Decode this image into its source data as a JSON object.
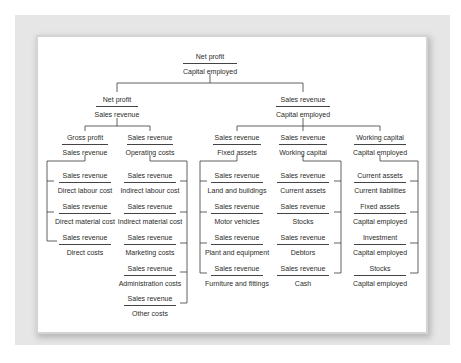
{
  "diagram": {
    "nodes": [
      {
        "id": "root",
        "num": "Net profit",
        "den": "Capital employed",
        "x": 210,
        "y": 52,
        "w": 54
      },
      {
        "id": "l1_left",
        "num": "Net profit",
        "den": "Sales revenue",
        "x": 117,
        "y": 95,
        "w": 42
      },
      {
        "id": "l1_right",
        "num": "Sales revenue",
        "den": "Capital employed",
        "x": 303,
        "y": 95,
        "w": 54
      },
      {
        "id": "gross_profit",
        "num": "Gross profit",
        "den": "Sales revenue",
        "x": 85,
        "y": 133,
        "w": 46
      },
      {
        "id": "operating_costs",
        "num": "Sales revenue",
        "den": "Operating costs",
        "x": 150,
        "y": 133,
        "w": 46
      },
      {
        "id": "fixed_assets",
        "num": "Sales revenue",
        "den": "Fixed assets",
        "x": 237,
        "y": 133,
        "w": 48
      },
      {
        "id": "working_capital",
        "num": "Sales revenue",
        "den": "Working capital",
        "x": 303,
        "y": 133,
        "w": 48
      },
      {
        "id": "wc_capital",
        "num": "Working capital",
        "den": "Capital employed",
        "x": 380,
        "y": 133,
        "w": 52
      },
      {
        "id": "direct_labour",
        "num": "Sales revenue",
        "den": "Direct labour cost",
        "x": 85,
        "y": 171,
        "w": 52
      },
      {
        "id": "direct_material",
        "num": "Sales revenue",
        "den": "Direct material cost",
        "x": 85,
        "y": 202,
        "w": 52
      },
      {
        "id": "direct_costs",
        "num": "Sales revenue",
        "den": "Direct costs",
        "x": 85,
        "y": 233,
        "w": 52
      },
      {
        "id": "indirect_labour",
        "num": "Sales revenue",
        "den": "Indirect labour cost",
        "x": 150,
        "y": 171,
        "w": 52
      },
      {
        "id": "indirect_material",
        "num": "Sales revenue",
        "den": "Indirect material cost",
        "x": 150,
        "y": 202,
        "w": 52
      },
      {
        "id": "marketing",
        "num": "Sales revenue",
        "den": "Marketing costs",
        "x": 150,
        "y": 233,
        "w": 52
      },
      {
        "id": "administration",
        "num": "Sales revenue",
        "den": "Administration costs",
        "x": 150,
        "y": 264,
        "w": 52
      },
      {
        "id": "other_costs",
        "num": "Sales revenue",
        "den": "Other costs",
        "x": 150,
        "y": 294,
        "w": 52
      },
      {
        "id": "land_buildings",
        "num": "Sales revenue",
        "den": "Land and buildings",
        "x": 237,
        "y": 171,
        "w": 52
      },
      {
        "id": "motor_vehicles",
        "num": "Sales revenue",
        "den": "Motor vehicles",
        "x": 237,
        "y": 202,
        "w": 52
      },
      {
        "id": "plant_equipment",
        "num": "Sales revenue",
        "den": "Plant and equipment",
        "x": 237,
        "y": 233,
        "w": 52
      },
      {
        "id": "furniture",
        "num": "Sales revenue",
        "den": "Furniture and fittings",
        "x": 237,
        "y": 264,
        "w": 52
      },
      {
        "id": "current_assets",
        "num": "Sales revenue",
        "den": "Current assets",
        "x": 303,
        "y": 171,
        "w": 52
      },
      {
        "id": "stocks",
        "num": "Sales revenue",
        "den": "Stocks",
        "x": 303,
        "y": 202,
        "w": 52
      },
      {
        "id": "debtors",
        "num": "Sales revenue",
        "den": "Debtors",
        "x": 303,
        "y": 233,
        "w": 52
      },
      {
        "id": "cash",
        "num": "Sales revenue",
        "den": "Cash",
        "x": 303,
        "y": 264,
        "w": 52
      },
      {
        "id": "current_ratio",
        "num": "Current assets",
        "den": "Current liabilities",
        "x": 380,
        "y": 171,
        "w": 52
      },
      {
        "id": "fa_ce",
        "num": "Fixed assets",
        "den": "Capital employed",
        "x": 380,
        "y": 202,
        "w": 52
      },
      {
        "id": "investment_ce",
        "num": "Investment",
        "den": "Capital employed",
        "x": 380,
        "y": 233,
        "w": 52
      },
      {
        "id": "stocks_ce",
        "num": "Stocks",
        "den": "Capital employed",
        "x": 380,
        "y": 264,
        "w": 52
      }
    ]
  }
}
